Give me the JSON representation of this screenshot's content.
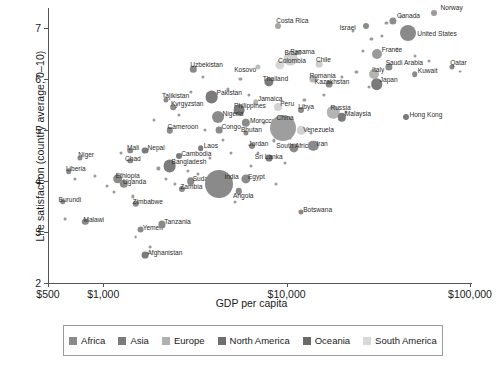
{
  "chart_data": {
    "type": "scatter",
    "title": "",
    "xlabel": "GDP per capita",
    "ylabel": "Life satisfaction (country average; 0–10)",
    "x_scale": "log",
    "xlim": [
      500,
      100000
    ],
    "ylim": [
      2,
      7.4
    ],
    "xticks": [
      500,
      1000,
      10000,
      100000
    ],
    "xticklabels": [
      "$500",
      "$1,000",
      "$10,000",
      "$100,000"
    ],
    "yticks": [
      2,
      3,
      4,
      5,
      6,
      7
    ],
    "yticklabels": [
      "2",
      "3",
      "4",
      "5",
      "6",
      "7"
    ],
    "grid": false,
    "legend_position": "below-axis",
    "size_encodes": "population",
    "legend": [
      {
        "label": "Africa",
        "color": "#8a8a8a"
      },
      {
        "label": "Asia",
        "color": "#7b7b7b"
      },
      {
        "label": "Europe",
        "color": "#b0b0b0"
      },
      {
        "label": "North America",
        "color": "#6f6f6f"
      },
      {
        "label": "Oceania",
        "color": "#6a6a6a"
      },
      {
        "label": "South America",
        "color": "#d8d8d8"
      }
    ],
    "points": [
      {
        "name": "Norway",
        "gdp": 64000,
        "life": 7.3,
        "r": 3.0,
        "c": "#9a9a9a",
        "lx": 6,
        "ly": -9
      },
      {
        "name": "Canada",
        "gdp": 38000,
        "life": 7.15,
        "r": 3.6,
        "c": "#8d8d8d",
        "lx": 4,
        "ly": -9
      },
      {
        "name": "Israel",
        "gdp": 27000,
        "life": 7.05,
        "r": 3.0,
        "c": "#8a8a8a",
        "lx": -26,
        "ly": -2
      },
      {
        "name": "United States",
        "gdp": 46000,
        "life": 6.9,
        "r": 8.0,
        "c": "#8a8a8a",
        "lx": 9,
        "ly": -3
      },
      {
        "name": "Costa Rica",
        "gdp": 9000,
        "life": 7.05,
        "r": 3.0,
        "c": "#a6a6a6",
        "lx": -2,
        "ly": -9
      },
      {
        "name": "France",
        "gdp": 31000,
        "life": 6.5,
        "r": 5.0,
        "c": "#9a9a9a",
        "lx": 5,
        "ly": -8
      },
      {
        "name": "Panama",
        "gdp": 11000,
        "life": 6.45,
        "r": 3.0,
        "c": "#bdbdbd",
        "lx": -4,
        "ly": -8
      },
      {
        "name": "Saudi Arabia",
        "gdp": 36000,
        "life": 6.25,
        "r": 3.6,
        "c": "#8a8a8a",
        "lx": -3,
        "ly": -8
      },
      {
        "name": "Qatar",
        "gdp": 80000,
        "life": 6.25,
        "r": 2.6,
        "c": "#8a8a8a",
        "lx": -2,
        "ly": -8
      },
      {
        "name": "Brazil",
        "gdp": 10500,
        "life": 6.4,
        "r": 6.6,
        "c": "#cfcfcf",
        "lx": -6,
        "ly": -10
      },
      {
        "name": "Chile",
        "gdp": 15000,
        "life": 6.3,
        "r": 3.4,
        "c": "#cdcdcd",
        "lx": -3,
        "ly": -8
      },
      {
        "name": "Colombia",
        "gdp": 9200,
        "life": 6.28,
        "r": 4.6,
        "c": "#d6d6d6",
        "lx": -2,
        "ly": -8
      },
      {
        "name": "Kosovo",
        "gdp": 7000,
        "life": 6.25,
        "r": 2.6,
        "c": "#bdbdbd",
        "lx": -24,
        "ly": -1
      },
      {
        "name": "Uzbekistan",
        "gdp": 3100,
        "life": 6.2,
        "r": 3.2,
        "c": "#8a8a8a",
        "lx": -3,
        "ly": -8
      },
      {
        "name": "Italy",
        "gdp": 30000,
        "life": 6.1,
        "r": 5.0,
        "c": "#b4b4b4",
        "lx": -2,
        "ly": -8
      },
      {
        "name": "Kuwait",
        "gdp": 50000,
        "life": 6.1,
        "r": 2.8,
        "c": "#8a8a8a",
        "lx": 3,
        "ly": -7
      },
      {
        "name": "Romania",
        "gdp": 14000,
        "life": 6.0,
        "r": 3.6,
        "c": "#b4b4b4",
        "lx": -4,
        "ly": -7
      },
      {
        "name": "Thailand",
        "gdp": 8000,
        "life": 5.95,
        "r": 4.6,
        "c": "#7b7b7b",
        "lx": -6,
        "ly": -7
      },
      {
        "name": "Japan",
        "gdp": 31000,
        "life": 5.9,
        "r": 5.8,
        "c": "#7b7b7b",
        "lx": 3,
        "ly": -8
      },
      {
        "name": "Kazakhstan",
        "gdp": 17000,
        "life": 5.9,
        "r": 3.4,
        "c": "#8a8a8a",
        "lx": -14,
        "ly": -6
      },
      {
        "name": "Pakistan",
        "gdp": 3900,
        "life": 5.65,
        "r": 6.4,
        "c": "#7b7b7b",
        "lx": 5,
        "ly": -8
      },
      {
        "name": "Tajikistan",
        "gdp": 2200,
        "life": 5.6,
        "r": 2.6,
        "c": "#8a8a8a",
        "lx": -4,
        "ly": -8
      },
      {
        "name": "Kyrgyzstan",
        "gdp": 2400,
        "life": 5.45,
        "r": 2.8,
        "c": "#8a8a8a",
        "lx": -2,
        "ly": -7
      },
      {
        "name": "Jamaica",
        "gdp": 6800,
        "life": 5.55,
        "r": 2.8,
        "c": "#b5b5b5",
        "lx": 2,
        "ly": -7
      },
      {
        "name": "Peru",
        "gdp": 9000,
        "life": 5.45,
        "r": 4.0,
        "c": "#d2d2d2",
        "lx": 2,
        "ly": -7
      },
      {
        "name": "Philippines",
        "gdp": 5500,
        "life": 5.4,
        "r": 5.4,
        "c": "#7b7b7b",
        "lx": -5,
        "ly": -8
      },
      {
        "name": "Libya",
        "gdp": 12000,
        "life": 5.4,
        "r": 3.0,
        "c": "#8a8a8a",
        "lx": -3,
        "ly": -7
      },
      {
        "name": "Russia",
        "gdp": 18000,
        "life": 5.35,
        "r": 6.2,
        "c": "#b4b4b4",
        "lx": -3,
        "ly": -8
      },
      {
        "name": "Nigeria",
        "gdp": 4200,
        "life": 5.25,
        "r": 6.0,
        "c": "#8a8a8a",
        "lx": 5,
        "ly": -7
      },
      {
        "name": "Morocco",
        "gdp": 6000,
        "life": 5.15,
        "r": 4.2,
        "c": "#8a8a8a",
        "lx": 4,
        "ly": -6
      },
      {
        "name": "Malaysia",
        "gdp": 20000,
        "life": 5.25,
        "r": 4.2,
        "c": "#7b7b7b",
        "lx": 3,
        "ly": -7
      },
      {
        "name": "Hong Kong",
        "gdp": 45000,
        "life": 5.25,
        "r": 3.0,
        "c": "#7b7b7b",
        "lx": 3,
        "ly": -6
      },
      {
        "name": "Cameroon",
        "gdp": 2300,
        "life": 5.0,
        "r": 3.2,
        "c": "#8a8a8a",
        "lx": -2,
        "ly": -7
      },
      {
        "name": "Congo",
        "gdp": 4300,
        "life": 5.0,
        "r": 3.4,
        "c": "#8a8a8a",
        "lx": 2,
        "ly": -7
      },
      {
        "name": "China",
        "gdp": 9500,
        "life": 5.05,
        "r": 13.0,
        "c": "#9e9e9e",
        "lx": -6,
        "ly": -14
      },
      {
        "name": "Venezuela",
        "gdp": 12000,
        "life": 5.0,
        "r": 4.2,
        "c": "#d2d2d2",
        "lx": 2,
        "ly": -4
      },
      {
        "name": "Bhutan",
        "gdp": 6000,
        "life": 4.95,
        "r": 2.6,
        "c": "#8a8a8a",
        "lx": -5,
        "ly": -7
      },
      {
        "name": "Nepal",
        "gdp": 1700,
        "life": 4.6,
        "r": 3.4,
        "c": "#7b7b7b",
        "lx": 2,
        "ly": -7
      },
      {
        "name": "Mali",
        "gdp": 1400,
        "life": 4.6,
        "r": 2.8,
        "c": "#8a8a8a",
        "lx": -3,
        "ly": -7
      },
      {
        "name": "Laos",
        "gdp": 3400,
        "life": 4.65,
        "r": 2.8,
        "c": "#7b7b7b",
        "lx": 3,
        "ly": -6
      },
      {
        "name": "Niger",
        "gdp": 750,
        "life": 4.45,
        "r": 2.6,
        "c": "#8a8a8a",
        "lx": -2,
        "ly": -7
      },
      {
        "name": "Chad",
        "gdp": 1400,
        "life": 4.4,
        "r": 2.8,
        "c": "#8a8a8a",
        "lx": -5,
        "ly": -6
      },
      {
        "name": "Cambodia",
        "gdp": 2600,
        "life": 4.5,
        "r": 3.0,
        "c": "#7b7b7b",
        "lx": 2,
        "ly": -6
      },
      {
        "name": "Jordan",
        "gdp": 6500,
        "life": 4.7,
        "r": 3.0,
        "c": "#8a8a8a",
        "lx": -4,
        "ly": -6
      },
      {
        "name": "Bangladesh",
        "gdp": 2300,
        "life": 4.3,
        "r": 6.4,
        "c": "#7b7b7b",
        "lx": 2,
        "ly": -8
      },
      {
        "name": "Liberia",
        "gdp": 650,
        "life": 4.2,
        "r": 2.8,
        "c": "#8a8a8a",
        "lx": -3,
        "ly": -6
      },
      {
        "name": "Ethiopia",
        "gdp": 1200,
        "life": 4.05,
        "r": 4.8,
        "c": "#8a8a8a",
        "lx": -2,
        "ly": -7
      },
      {
        "name": "Uganda",
        "gdp": 1300,
        "life": 3.95,
        "r": 4.2,
        "c": "#8a8a8a",
        "lx": -1,
        "ly": -6
      },
      {
        "name": "Sudan",
        "gdp": 3000,
        "life": 4.0,
        "r": 3.8,
        "c": "#8a8a8a",
        "lx": 2,
        "ly": -6
      },
      {
        "name": "India",
        "gdp": 4300,
        "life": 3.95,
        "r": 14.0,
        "c": "#8a8a8a",
        "lx": 5,
        "ly": -11
      },
      {
        "name": "Zambia",
        "gdp": 2700,
        "life": 3.85,
        "r": 3.0,
        "c": "#8a8a8a",
        "lx": -2,
        "ly": -6
      },
      {
        "name": "Angola",
        "gdp": 5500,
        "life": 3.8,
        "r": 3.2,
        "c": "#8a8a8a",
        "lx": -6,
        "ly": 1
      },
      {
        "name": "South Africa",
        "gdp": 11000,
        "life": 4.65,
        "r": 4.6,
        "c": "#8a8a8a",
        "lx": -18,
        "ly": -6
      },
      {
        "name": "Sri Lanka",
        "gdp": 8000,
        "life": 4.45,
        "r": 3.4,
        "c": "#7b7b7b",
        "lx": -14,
        "ly": -5
      },
      {
        "name": "Iran",
        "gdp": 14000,
        "life": 4.7,
        "r": 5.2,
        "c": "#8a8a8a",
        "lx": 3,
        "ly": -6
      },
      {
        "name": "Egypt",
        "gdp": 6000,
        "life": 4.05,
        "r": 4.6,
        "c": "#8a8a8a",
        "lx": 2,
        "ly": -6
      },
      {
        "name": "Botswana",
        "gdp": 12000,
        "life": 3.4,
        "r": 2.6,
        "c": "#8a8a8a",
        "lx": 2,
        "ly": -6
      },
      {
        "name": "Zimbabwe",
        "gdp": 1500,
        "life": 3.55,
        "r": 3.2,
        "c": "#8a8a8a",
        "lx": -3,
        "ly": -6
      },
      {
        "name": "Burundi",
        "gdp": 600,
        "life": 3.6,
        "r": 2.8,
        "c": "#8a8a8a",
        "lx": -4,
        "ly": -6
      },
      {
        "name": "Malawi",
        "gdp": 800,
        "life": 3.2,
        "r": 3.2,
        "c": "#8a8a8a",
        "lx": -2,
        "ly": -6
      },
      {
        "name": "Yemen",
        "gdp": 1600,
        "life": 3.05,
        "r": 3.4,
        "c": "#8a8a8a",
        "lx": 2,
        "ly": -6
      },
      {
        "name": "Tanzania",
        "gdp": 2100,
        "life": 3.15,
        "r": 3.6,
        "c": "#8a8a8a",
        "lx": 2,
        "ly": -6
      },
      {
        "name": "Afghanistan",
        "gdp": 1700,
        "life": 2.55,
        "r": 3.4,
        "c": "#7b7b7b",
        "lx": 2,
        "ly": -6
      }
    ],
    "extra_points": [
      {
        "gdp": 700,
        "life": 4.05,
        "r": 1.6
      },
      {
        "gdp": 900,
        "life": 4.1,
        "r": 1.6
      },
      {
        "gdp": 1050,
        "life": 3.9,
        "r": 1.5
      },
      {
        "gdp": 1150,
        "life": 3.78,
        "r": 1.5
      },
      {
        "gdp": 620,
        "life": 3.25,
        "r": 1.4
      },
      {
        "gdp": 1450,
        "life": 3.7,
        "r": 1.6
      },
      {
        "gdp": 1500,
        "life": 2.9,
        "r": 1.4
      },
      {
        "gdp": 1800,
        "life": 2.7,
        "r": 1.4
      },
      {
        "gdp": 2000,
        "life": 4.25,
        "r": 1.6
      },
      {
        "gdp": 2450,
        "life": 3.95,
        "r": 1.6
      },
      {
        "gdp": 2900,
        "life": 4.2,
        "r": 1.6
      },
      {
        "gdp": 3300,
        "life": 4.15,
        "r": 1.6
      },
      {
        "gdp": 3800,
        "life": 4.45,
        "r": 1.6
      },
      {
        "gdp": 1900,
        "life": 5.2,
        "r": 1.5
      },
      {
        "gdp": 2600,
        "life": 5.3,
        "r": 1.6
      },
      {
        "gdp": 3000,
        "life": 5.75,
        "r": 1.6
      },
      {
        "gdp": 3500,
        "life": 6.05,
        "r": 1.6
      },
      {
        "gdp": 4800,
        "life": 5.8,
        "r": 1.6
      },
      {
        "gdp": 5600,
        "life": 6.0,
        "r": 1.6
      },
      {
        "gdp": 6200,
        "life": 5.7,
        "r": 1.6
      },
      {
        "gdp": 7500,
        "life": 5.15,
        "r": 1.6
      },
      {
        "gdp": 8500,
        "life": 4.8,
        "r": 1.6
      },
      {
        "gdp": 9800,
        "life": 4.35,
        "r": 1.5
      },
      {
        "gdp": 6400,
        "life": 4.3,
        "r": 1.5
      },
      {
        "gdp": 5000,
        "life": 4.55,
        "r": 1.5
      },
      {
        "gdp": 7000,
        "life": 4.55,
        "r": 1.5
      },
      {
        "gdp": 12500,
        "life": 5.6,
        "r": 1.6
      },
      {
        "gdp": 16000,
        "life": 5.7,
        "r": 1.6
      },
      {
        "gdp": 20000,
        "life": 6.05,
        "r": 1.6
      },
      {
        "gdp": 24000,
        "life": 6.15,
        "r": 1.6
      },
      {
        "gdp": 26000,
        "life": 6.55,
        "r": 1.6
      },
      {
        "gdp": 23000,
        "life": 6.95,
        "r": 1.5
      },
      {
        "gdp": 29000,
        "life": 6.8,
        "r": 1.6
      },
      {
        "gdp": 33000,
        "life": 6.85,
        "r": 1.6
      },
      {
        "gdp": 35000,
        "life": 7.1,
        "r": 1.6
      },
      {
        "gdp": 42000,
        "life": 7.25,
        "r": 1.5
      },
      {
        "gdp": 40000,
        "life": 6.6,
        "r": 1.6
      },
      {
        "gdp": 50000,
        "life": 6.45,
        "r": 1.5
      },
      {
        "gdp": 60000,
        "life": 6.35,
        "r": 1.5
      },
      {
        "gdp": 88000,
        "life": 6.15,
        "r": 1.4
      },
      {
        "gdp": 28000,
        "life": 5.85,
        "r": 1.5
      },
      {
        "gdp": 21000,
        "life": 5.35,
        "r": 1.5
      },
      {
        "gdp": 13500,
        "life": 4.95,
        "r": 1.5
      },
      {
        "gdp": 10500,
        "life": 4.85,
        "r": 1.5
      },
      {
        "gdp": 4500,
        "life": 4.8,
        "r": 1.5
      },
      {
        "gdp": 3600,
        "life": 5.0,
        "r": 1.5
      },
      {
        "gdp": 2200,
        "life": 4.05,
        "r": 1.5
      },
      {
        "gdp": 1250,
        "life": 4.55,
        "r": 1.5
      },
      {
        "gdp": 8800,
        "life": 3.95,
        "r": 1.5
      },
      {
        "gdp": 5200,
        "life": 3.6,
        "r": 1.5
      }
    ]
  }
}
